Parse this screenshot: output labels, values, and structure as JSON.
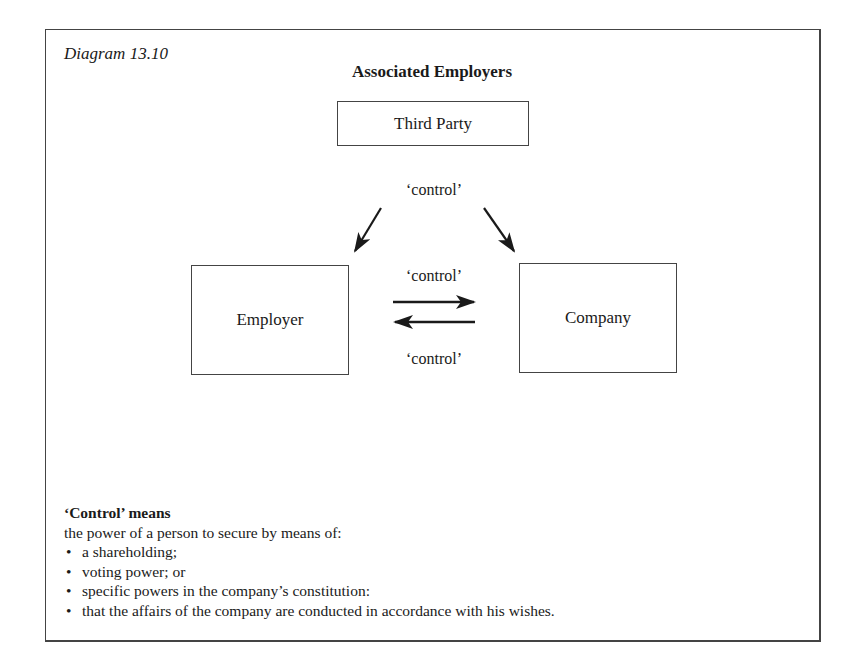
{
  "diagram": {
    "caption": "Diagram 13.10",
    "title": "Associated Employers",
    "nodes": {
      "third_party": "Third Party",
      "employer": "Employer",
      "company": "Company"
    },
    "edges": {
      "third_party_label": "‘control’",
      "employer_to_company_label": "‘control’",
      "company_to_employer_label": "‘control’"
    }
  },
  "definition": {
    "heading": "‘Control’ means",
    "intro": "the power of a person to secure by means of:",
    "items": [
      "a shareholding;",
      "voting power; or",
      "specific powers in the company’s constitution:",
      "that the affairs of the company are conducted in accordance with his wishes."
    ]
  },
  "colors": {
    "line": "#444444",
    "text": "#1a1a1a",
    "background": "#ffffff"
  }
}
